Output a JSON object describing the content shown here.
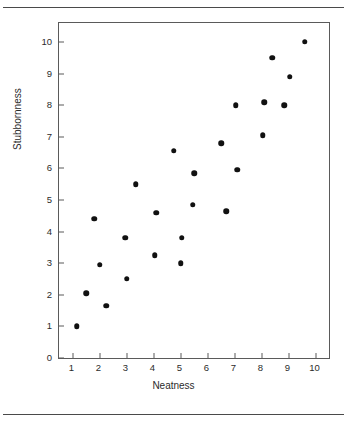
{
  "chart_data": {
    "type": "scatter",
    "title": "",
    "xlabel": "Neatness",
    "ylabel": "Stubbornness",
    "xlim": [
      0.5,
      10.5
    ],
    "ylim": [
      0,
      10.6
    ],
    "xticks": [
      1,
      2,
      3,
      4,
      5,
      6,
      7,
      8,
      9,
      10
    ],
    "yticks": [
      0,
      1,
      2,
      3,
      4,
      5,
      6,
      7,
      8,
      9,
      10
    ],
    "xticklabels": [
      "1",
      "2",
      "3",
      "4",
      "5",
      "6",
      "7",
      "8",
      "9",
      "10"
    ],
    "yticklabels": [
      "0",
      "1",
      "2",
      "3",
      "4",
      "5",
      "6",
      "7",
      "8",
      "9",
      "10"
    ],
    "grid": false,
    "legend": false,
    "marker": "filled-circle",
    "marker_color": "#111111",
    "points": [
      {
        "x": 1.15,
        "y": 1.0
      },
      {
        "x": 1.5,
        "y": 2.05
      },
      {
        "x": 1.8,
        "y": 4.4
      },
      {
        "x": 2.0,
        "y": 2.95
      },
      {
        "x": 2.25,
        "y": 1.65
      },
      {
        "x": 2.95,
        "y": 3.8
      },
      {
        "x": 3.0,
        "y": 2.5
      },
      {
        "x": 3.35,
        "y": 5.5
      },
      {
        "x": 4.05,
        "y": 3.25
      },
      {
        "x": 4.1,
        "y": 4.6
      },
      {
        "x": 4.75,
        "y": 6.55
      },
      {
        "x": 5.0,
        "y": 3.0
      },
      {
        "x": 5.05,
        "y": 3.8
      },
      {
        "x": 5.45,
        "y": 4.85
      },
      {
        "x": 5.5,
        "y": 5.85
      },
      {
        "x": 6.5,
        "y": 6.8
      },
      {
        "x": 6.7,
        "y": 4.65
      },
      {
        "x": 7.05,
        "y": 8.0
      },
      {
        "x": 7.1,
        "y": 5.95
      },
      {
        "x": 8.05,
        "y": 7.05
      },
      {
        "x": 8.1,
        "y": 8.1
      },
      {
        "x": 8.4,
        "y": 9.5
      },
      {
        "x": 8.85,
        "y": 8.0
      },
      {
        "x": 9.05,
        "y": 8.9
      },
      {
        "x": 9.6,
        "y": 10.0
      }
    ]
  },
  "figure": {
    "background_color": "#ffffff",
    "frame_color": "#5a5a5a",
    "rule_color": "#4a4a4a"
  }
}
